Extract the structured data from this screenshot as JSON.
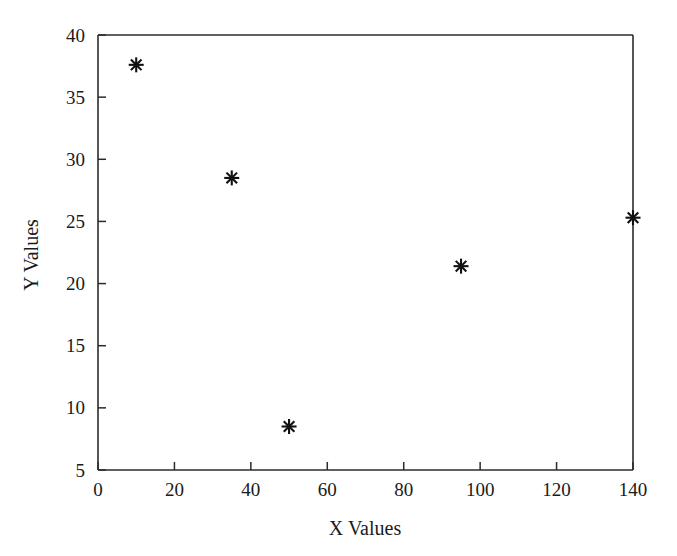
{
  "chart_data": {
    "type": "scatter",
    "title": "",
    "xlabel": "X Values",
    "ylabel": "Y Values",
    "xlim": [
      0,
      140
    ],
    "ylim": [
      5,
      40
    ],
    "xticks": [
      0,
      20,
      40,
      60,
      80,
      100,
      120,
      140
    ],
    "yticks": [
      5,
      10,
      15,
      20,
      25,
      30,
      35,
      40
    ],
    "xtick_labels": [
      "0",
      "20",
      "40",
      "60",
      "80",
      "100",
      "120",
      "140"
    ],
    "ytick_labels": [
      "5",
      "10",
      "15",
      "20",
      "25",
      "30",
      "35",
      "40"
    ],
    "grid": false,
    "legend": null,
    "marker": "asterisk",
    "marker_color": "#111111",
    "series": [
      {
        "name": "data",
        "points": [
          {
            "x": 10,
            "y": 37.6
          },
          {
            "x": 35,
            "y": 28.5
          },
          {
            "x": 50,
            "y": 8.5
          },
          {
            "x": 95,
            "y": 21.4
          },
          {
            "x": 140,
            "y": 25.3
          }
        ]
      }
    ]
  },
  "figure": {
    "background_color": "#ffffff",
    "axis_color": "#2b2b2b"
  }
}
